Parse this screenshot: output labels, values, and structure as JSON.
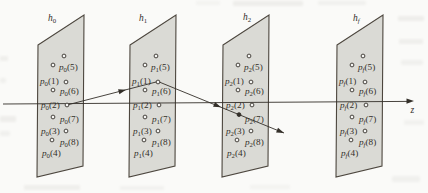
{
  "colors": {
    "paper": "#fafaf8",
    "plane_fill": "#dadad5",
    "plane_stroke": "#4c463e",
    "ink": "#332f29",
    "point_fill": "#f6f6f4",
    "noise": "#8a867e"
  },
  "plane_symbol": "h",
  "point_symbol": "p",
  "axis": {
    "label": "z",
    "from": [
      3,
      104
    ],
    "to": [
      407,
      101.4
    ],
    "arrow": {
      "x": 414,
      "y": 101,
      "angle": -0.4
    },
    "label_pos": [
      410.5,
      112.5
    ]
  },
  "plane_shape": {
    "tl": 45,
    "tr": 15,
    "br": 166,
    "bl": 177,
    "width": 46
  },
  "planes": [
    {
      "sub": "0",
      "left": 38,
      "label_x": 48,
      "label_y": 21
    },
    {
      "sub": "1",
      "left": 130,
      "label_x": 139,
      "label_y": 21
    },
    {
      "sub": "2",
      "left": 223,
      "label_x": 243,
      "label_y": 20
    },
    {
      "sub": "f",
      "left": 337,
      "label_x": 353,
      "label_y": 21
    }
  ],
  "rows": [
    {
      "circle": [
        26,
        56
      ],
      "label": null
    },
    {
      "circle": [
        15,
        65
      ],
      "label": {
        "text": "(5)",
        "x": 21,
        "y": 70
      }
    },
    {
      "circle": [
        28,
        82
      ],
      "label": {
        "text": "(1)",
        "x": 2,
        "y": 84
      }
    },
    {
      "circle": [
        15,
        90
      ],
      "label": {
        "text": "(6)",
        "x": 22,
        "y": 94
      }
    },
    {
      "circle": [
        29,
        105
      ],
      "label": {
        "text": "(2)",
        "x": 3,
        "y": 108
      }
    },
    {
      "circle": [
        15,
        117
      ],
      "label": {
        "text": "(7)",
        "x": 22,
        "y": 122
      }
    },
    {
      "circle": [
        28,
        131
      ],
      "label": {
        "text": "(3)",
        "x": 3,
        "y": 134
      }
    },
    {
      "circle": [
        14,
        140
      ],
      "label": {
        "text": "(8)",
        "x": 22,
        "y": 145
      }
    },
    {
      "circle": null,
      "label": {
        "text": "(4)",
        "x": 4,
        "y": 156
      }
    }
  ],
  "ray": {
    "segments": [
      {
        "from": [
          67,
          105
        ],
        "to": [
          158,
          81.5
        ]
      },
      {
        "from": [
          158,
          81.5
        ],
        "to": [
          284,
          133
        ]
      }
    ],
    "arrowheads": [
      {
        "x": 126,
        "y": 89.8,
        "angle": -14.5
      },
      {
        "x": 221,
        "y": 107.2,
        "angle": 22.2
      },
      {
        "x": 284,
        "y": 133,
        "angle": 22.2
      }
    ],
    "crossing_dot": [
      239,
      114.6
    ],
    "crossing_plane_index": 2,
    "crossing_row_index": 5
  },
  "noise": [
    [
      233,
      1,
      70,
      5,
      0.1
    ],
    [
      318,
      1,
      48,
      4,
      0.08
    ],
    [
      196,
      1,
      24,
      4,
      0.06
    ],
    [
      398,
      16,
      26,
      5,
      0.1
    ],
    [
      399,
      39,
      24,
      5,
      0.09
    ],
    [
      401,
      60,
      22,
      5,
      0.08
    ],
    [
      404,
      120,
      20,
      5,
      0.07
    ],
    [
      0,
      56,
      8,
      5,
      0.09
    ],
    [
      0,
      78,
      6,
      5,
      0.08
    ],
    [
      0,
      116,
      16,
      6,
      0.1
    ],
    [
      0,
      131,
      10,
      5,
      0.08
    ],
    [
      24,
      185,
      56,
      5,
      0.09
    ],
    [
      120,
      186,
      44,
      4,
      0.07
    ],
    [
      250,
      185,
      40,
      4,
      0.06
    ],
    [
      392,
      176,
      28,
      6,
      0.08
    ]
  ]
}
